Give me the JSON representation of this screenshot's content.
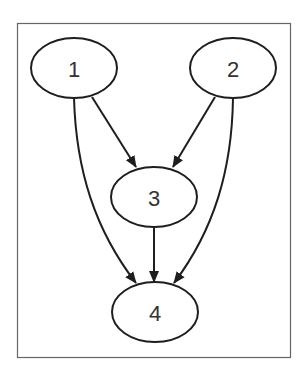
{
  "diagram": {
    "type": "directed-graph",
    "nodes": [
      {
        "id": "1",
        "label": "1"
      },
      {
        "id": "2",
        "label": "2"
      },
      {
        "id": "3",
        "label": "3"
      },
      {
        "id": "4",
        "label": "4"
      }
    ],
    "edges": [
      {
        "from": "1",
        "to": "3"
      },
      {
        "from": "1",
        "to": "4"
      },
      {
        "from": "2",
        "to": "3"
      },
      {
        "from": "2",
        "to": "4"
      },
      {
        "from": "3",
        "to": "4"
      }
    ]
  }
}
